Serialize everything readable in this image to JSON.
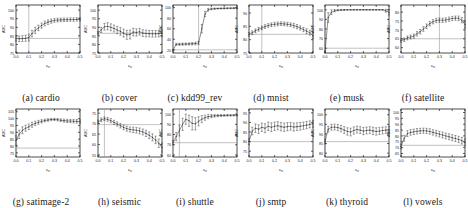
{
  "figure": {
    "xlabel": "c_p",
    "ylabel": "AUC",
    "xticks": [
      "0.0",
      "0.1",
      "0.2",
      "0.3",
      "0.4",
      "0.5"
    ],
    "xlim": [
      0.0,
      0.5
    ],
    "marker": "caret",
    "line_color": "#333333",
    "ref_line_color": "#999999",
    "vline_color": "#999999"
  },
  "chart_data": [
    {
      "type": "line",
      "panel": "a",
      "title": "(a) cardio",
      "xlabel": "c_p",
      "ylabel": "AUC",
      "xlim": [
        0.0,
        0.5
      ],
      "ylim": [
        75,
        103
      ],
      "yticks": [
        75,
        80,
        85,
        90,
        95,
        100
      ],
      "grid": false,
      "reference_line": 83.5,
      "vline": 0.1,
      "x": [
        0.0,
        0.025,
        0.05,
        0.075,
        0.1,
        0.125,
        0.15,
        0.175,
        0.2,
        0.225,
        0.25,
        0.275,
        0.3,
        0.325,
        0.35,
        0.375,
        0.4,
        0.425,
        0.45,
        0.475,
        0.5
      ],
      "values": [
        83.5,
        83.3,
        83.4,
        83.6,
        84.0,
        86.3,
        88.2,
        89.6,
        91.0,
        92.2,
        93.0,
        93.6,
        94.0,
        94.2,
        94.3,
        94.4,
        94.4,
        94.5,
        94.5,
        94.6,
        94.6
      ],
      "errors": [
        1.6,
        1.6,
        1.7,
        1.8,
        2.0,
        1.9,
        1.8,
        1.6,
        1.5,
        1.4,
        1.3,
        1.2,
        1.1,
        1.1,
        1.0,
        1.0,
        1.0,
        1.0,
        1.0,
        1.0,
        1.0
      ]
    },
    {
      "type": "line",
      "panel": "b",
      "title": "(b) cover",
      "xlabel": "c_p",
      "ylabel": "AUC",
      "xlim": [
        0.0,
        0.5
      ],
      "ylim": [
        75,
        103
      ],
      "yticks": [
        75,
        80,
        85,
        90,
        95,
        100
      ],
      "grid": false,
      "reference_line": 86.5,
      "vline": 0.0,
      "x": [
        0.0,
        0.025,
        0.05,
        0.075,
        0.1,
        0.125,
        0.15,
        0.175,
        0.2,
        0.225,
        0.25,
        0.275,
        0.3,
        0.325,
        0.35,
        0.375,
        0.4,
        0.425,
        0.45,
        0.475,
        0.5
      ],
      "values": [
        86.5,
        88.5,
        90.3,
        90.6,
        90.0,
        89.3,
        88.4,
        87.6,
        86.6,
        85.6,
        85.8,
        87.2,
        87.0,
        87.4,
        86.6,
        86.4,
        86.3,
        86.2,
        86.2,
        86.3,
        86.4
      ],
      "errors": [
        1.0,
        1.5,
        2.0,
        2.1,
        2.0,
        2.0,
        2.1,
        2.2,
        2.3,
        2.6,
        2.6,
        2.2,
        2.1,
        2.0,
        2.0,
        2.0,
        1.9,
        1.9,
        1.9,
        1.9,
        1.9
      ]
    },
    {
      "type": "line",
      "panel": "c",
      "title": "(c) kdd99_rev",
      "xlabel": "c_p",
      "ylabel": "AUC",
      "xlim": [
        0.0,
        0.5
      ],
      "ylim": [
        14,
        105
      ],
      "yticks": [
        20,
        40,
        60,
        80,
        100
      ],
      "grid": false,
      "reference_line": 20.0,
      "vline": 0.2,
      "x": [
        0.0,
        0.025,
        0.05,
        0.075,
        0.1,
        0.125,
        0.15,
        0.175,
        0.2,
        0.225,
        0.25,
        0.275,
        0.3,
        0.325,
        0.35,
        0.375,
        0.4,
        0.425,
        0.45,
        0.475,
        0.5
      ],
      "values": [
        19.5,
        30.5,
        30.5,
        30.8,
        31.0,
        31.2,
        31.5,
        32.0,
        33.0,
        60.0,
        88.0,
        96.0,
        97.5,
        98.0,
        98.3,
        98.5,
        98.6,
        98.8,
        98.9,
        99.0,
        99.0
      ],
      "errors": [
        1.0,
        2.0,
        2.0,
        2.0,
        2.0,
        2.0,
        2.2,
        2.5,
        3.0,
        8.0,
        5.0,
        2.5,
        1.5,
        1.2,
        1.0,
        1.0,
        1.0,
        0.9,
        0.9,
        0.8,
        0.8
      ]
    },
    {
      "type": "line",
      "panel": "d",
      "title": "(d) mnist",
      "xlabel": "c_p",
      "ylabel": "AUC",
      "xlim": [
        0.0,
        0.5
      ],
      "ylim": [
        75,
        93
      ],
      "yticks": [
        75,
        80,
        85,
        90
      ],
      "grid": false,
      "reference_line": 82.0,
      "vline": 0.1,
      "x": [
        0.0,
        0.025,
        0.05,
        0.075,
        0.1,
        0.125,
        0.15,
        0.175,
        0.2,
        0.225,
        0.25,
        0.275,
        0.3,
        0.325,
        0.35,
        0.375,
        0.4,
        0.425,
        0.45,
        0.475,
        0.5
      ],
      "values": [
        82.0,
        82.6,
        83.3,
        83.9,
        84.4,
        84.9,
        85.3,
        85.6,
        85.8,
        85.9,
        86.0,
        85.9,
        85.8,
        85.6,
        85.3,
        84.9,
        84.4,
        83.8,
        83.2,
        82.6,
        81.5
      ],
      "errors": [
        0.7,
        0.7,
        0.7,
        0.7,
        0.7,
        0.7,
        0.7,
        0.7,
        0.7,
        0.7,
        0.7,
        0.7,
        0.7,
        0.7,
        0.8,
        0.8,
        0.8,
        0.8,
        0.9,
        0.9,
        1.0
      ]
    },
    {
      "type": "line",
      "panel": "e",
      "title": "(e) musk",
      "xlabel": "c_p",
      "ylabel": "AUC",
      "xlim": [
        0.0,
        0.5
      ],
      "ylim": [
        55,
        105
      ],
      "yticks": [
        60,
        70,
        80,
        90,
        100
      ],
      "grid": false,
      "reference_line": 60.0,
      "vline": 0.0,
      "x": [
        0.0,
        0.025,
        0.05,
        0.075,
        0.1,
        0.125,
        0.15,
        0.175,
        0.2,
        0.225,
        0.25,
        0.275,
        0.3,
        0.325,
        0.35,
        0.375,
        0.4,
        0.425,
        0.45,
        0.475,
        0.5
      ],
      "values": [
        56.0,
        92.0,
        97.5,
        99.0,
        99.6,
        99.8,
        99.9,
        100.0,
        100.0,
        100.0,
        100.0,
        100.0,
        100.0,
        100.0,
        100.0,
        100.0,
        100.0,
        100.0,
        100.0,
        99.0,
        97.5
      ],
      "errors": [
        1.0,
        5.0,
        2.5,
        1.2,
        0.6,
        0.4,
        0.3,
        0.2,
        0.2,
        0.2,
        0.2,
        0.2,
        0.2,
        0.2,
        0.2,
        0.2,
        0.2,
        0.2,
        0.3,
        1.5,
        3.0
      ]
    },
    {
      "type": "line",
      "panel": "f",
      "title": "(f) satellite",
      "xlabel": "c_p",
      "ylabel": "AUC",
      "xlim": [
        0.0,
        0.5
      ],
      "ylim": [
        57,
        84
      ],
      "yticks": [
        60,
        65,
        70,
        75,
        80
      ],
      "grid": false,
      "reference_line": 65.0,
      "vline": 0.3,
      "x": [
        0.0,
        0.025,
        0.05,
        0.075,
        0.1,
        0.125,
        0.15,
        0.175,
        0.2,
        0.225,
        0.25,
        0.275,
        0.3,
        0.325,
        0.35,
        0.375,
        0.4,
        0.425,
        0.45,
        0.475,
        0.5
      ],
      "values": [
        64.0,
        64.5,
        65.5,
        66.0,
        66.5,
        67.8,
        69.0,
        70.5,
        72.0,
        73.5,
        74.6,
        75.3,
        75.5,
        75.4,
        75.6,
        76.0,
        76.4,
        76.6,
        76.5,
        75.5,
        73.0
      ],
      "errors": [
        1.0,
        1.0,
        1.1,
        1.1,
        1.2,
        1.2,
        1.3,
        1.3,
        1.3,
        1.3,
        1.2,
        1.2,
        1.2,
        1.2,
        1.2,
        1.2,
        1.2,
        1.2,
        1.3,
        1.5,
        2.0
      ]
    },
    {
      "type": "line",
      "panel": "g",
      "title": "(g) satimage-2",
      "xlabel": "c_p",
      "ylabel": "AUC",
      "xlim": [
        0.0,
        0.5
      ],
      "ylim": [
        72,
        107
      ],
      "yticks": [
        75,
        80,
        85,
        90,
        95,
        100,
        105
      ],
      "grid": false,
      "reference_line": 78.5,
      "vline": 0.0,
      "x": [
        0.0,
        0.025,
        0.05,
        0.075,
        0.1,
        0.125,
        0.15,
        0.175,
        0.2,
        0.225,
        0.25,
        0.275,
        0.3,
        0.325,
        0.35,
        0.375,
        0.4,
        0.425,
        0.45,
        0.475,
        0.5
      ],
      "values": [
        84.0,
        88.5,
        91.5,
        93.0,
        94.0,
        95.5,
        96.5,
        97.3,
        98.0,
        98.6,
        99.0,
        99.3,
        99.4,
        99.2,
        98.8,
        98.5,
        98.3,
        98.2,
        98.1,
        98.0,
        97.8
      ],
      "errors": [
        3.5,
        3.0,
        2.5,
        2.2,
        2.0,
        1.8,
        1.6,
        1.4,
        1.2,
        1.0,
        0.9,
        0.8,
        0.8,
        0.9,
        1.0,
        1.1,
        1.2,
        1.2,
        1.2,
        1.3,
        1.3
      ]
    },
    {
      "type": "line",
      "panel": "h",
      "title": "(h) seismic",
      "xlabel": "c_p",
      "ylabel": "AUC",
      "xlim": [
        0.0,
        0.5
      ],
      "ylim": [
        54,
        77
      ],
      "yticks": [
        55,
        60,
        65,
        70,
        75
      ],
      "grid": false,
      "reference_line": 69.5,
      "vline": 0.05,
      "x": [
        0.0,
        0.025,
        0.05,
        0.075,
        0.1,
        0.125,
        0.15,
        0.175,
        0.2,
        0.225,
        0.25,
        0.275,
        0.3,
        0.325,
        0.35,
        0.375,
        0.4,
        0.425,
        0.45,
        0.475,
        0.5
      ],
      "values": [
        70.8,
        71.8,
        72.3,
        72.0,
        71.4,
        70.6,
        69.8,
        69.0,
        68.2,
        67.6,
        67.2,
        67.0,
        66.8,
        66.5,
        66.0,
        65.3,
        64.4,
        63.4,
        62.2,
        60.6,
        58.5
      ],
      "errors": [
        0.9,
        0.9,
        0.9,
        0.9,
        1.0,
        1.0,
        1.0,
        1.1,
        1.1,
        1.2,
        1.2,
        1.3,
        1.3,
        1.4,
        1.4,
        1.5,
        1.6,
        1.7,
        1.8,
        2.0,
        2.2
      ]
    },
    {
      "type": "line",
      "panel": "i",
      "title": "(i) shuttle",
      "xlabel": "c_p",
      "ylabel": "AUC",
      "xlim": [
        0.0,
        0.5
      ],
      "ylim": [
        58,
        105
      ],
      "yticks": [
        60,
        70,
        80,
        90,
        100
      ],
      "grid": false,
      "reference_line": 72.0,
      "vline": 0.05,
      "x": [
        0.0,
        0.025,
        0.05,
        0.075,
        0.1,
        0.125,
        0.15,
        0.175,
        0.2,
        0.225,
        0.25,
        0.275,
        0.3,
        0.325,
        0.35,
        0.375,
        0.4,
        0.425,
        0.45,
        0.475,
        0.5
      ],
      "values": [
        72.0,
        78.0,
        84.0,
        90.0,
        95.0,
        93.5,
        91.0,
        90.5,
        93.0,
        95.0,
        96.5,
        97.5,
        98.0,
        98.3,
        98.5,
        98.6,
        98.7,
        98.8,
        98.8,
        98.9,
        98.9
      ],
      "errors": [
        2.0,
        4.0,
        5.5,
        6.0,
        5.0,
        5.5,
        6.5,
        6.0,
        4.5,
        3.5,
        2.5,
        2.0,
        1.5,
        1.2,
        1.0,
        0.9,
        0.8,
        0.8,
        0.7,
        0.7,
        0.7
      ]
    },
    {
      "type": "line",
      "panel": "j",
      "title": "(j) smtp",
      "xlabel": "c_p",
      "ylabel": "AUC",
      "xlim": [
        0.0,
        0.5
      ],
      "ylim": [
        72,
        97
      ],
      "yticks": [
        75,
        80,
        85,
        90,
        95
      ],
      "grid": false,
      "reference_line": 80.0,
      "vline": 0.0,
      "x": [
        0.0,
        0.025,
        0.05,
        0.075,
        0.1,
        0.125,
        0.15,
        0.175,
        0.2,
        0.225,
        0.25,
        0.275,
        0.3,
        0.325,
        0.35,
        0.375,
        0.4,
        0.425,
        0.45,
        0.475,
        0.5
      ],
      "values": [
        80.0,
        85.5,
        87.0,
        86.5,
        87.5,
        87.0,
        88.0,
        87.5,
        88.0,
        88.3,
        87.8,
        87.5,
        87.8,
        88.0,
        87.6,
        87.8,
        88.0,
        88.3,
        88.6,
        89.0,
        89.3
      ],
      "errors": [
        1.5,
        2.0,
        2.2,
        2.3,
        2.2,
        2.3,
        2.2,
        2.3,
        2.2,
        2.1,
        2.2,
        2.2,
        2.1,
        2.0,
        2.1,
        2.0,
        2.0,
        1.9,
        1.9,
        1.8,
        1.8
      ]
    },
    {
      "type": "line",
      "panel": "k",
      "title": "(k) thyroid",
      "xlabel": "c_p",
      "ylabel": "AUC",
      "xlim": [
        0.0,
        0.5
      ],
      "ylim": [
        78,
        103
      ],
      "yticks": [
        80,
        85,
        90,
        95,
        100
      ],
      "grid": false,
      "reference_line": 86.0,
      "vline": 0.0,
      "x": [
        0.0,
        0.025,
        0.05,
        0.075,
        0.1,
        0.125,
        0.15,
        0.175,
        0.2,
        0.225,
        0.25,
        0.275,
        0.3,
        0.325,
        0.35,
        0.375,
        0.4,
        0.425,
        0.45,
        0.475,
        0.5
      ],
      "values": [
        86.0,
        92.5,
        93.5,
        93.6,
        93.3,
        92.8,
        92.0,
        91.3,
        91.0,
        91.8,
        92.3,
        92.0,
        91.5,
        91.8,
        92.0,
        91.6,
        91.3,
        91.5,
        91.8,
        92.0,
        92.2
      ],
      "errors": [
        1.2,
        1.5,
        1.5,
        1.5,
        1.6,
        1.7,
        1.8,
        1.9,
        2.0,
        1.9,
        1.8,
        1.8,
        1.9,
        1.8,
        1.8,
        1.9,
        1.9,
        1.8,
        1.8,
        1.7,
        1.7
      ]
    },
    {
      "type": "line",
      "panel": "l",
      "title": "(l) vowels",
      "xlabel": "c_p",
      "ylabel": "AUC",
      "xlim": [
        0.0,
        0.5
      ],
      "ylim": [
        62,
        103
      ],
      "yticks": [
        65,
        70,
        75,
        80,
        85,
        90,
        95,
        100
      ],
      "grid": false,
      "reference_line": 72.0,
      "vline": 0.0,
      "x": [
        0.0,
        0.025,
        0.05,
        0.075,
        0.1,
        0.125,
        0.15,
        0.175,
        0.2,
        0.225,
        0.25,
        0.275,
        0.3,
        0.325,
        0.35,
        0.375,
        0.4,
        0.425,
        0.45,
        0.475,
        0.5
      ],
      "values": [
        71.0,
        78.0,
        82.0,
        83.0,
        83.5,
        84.0,
        84.3,
        84.5,
        84.3,
        83.8,
        83.0,
        82.3,
        81.5,
        80.8,
        80.0,
        79.3,
        78.5,
        77.8,
        77.0,
        76.0,
        74.5
      ],
      "errors": [
        2.0,
        2.5,
        2.5,
        2.4,
        2.3,
        2.3,
        2.2,
        2.2,
        2.2,
        2.3,
        2.3,
        2.4,
        2.4,
        2.5,
        2.5,
        2.5,
        2.6,
        2.6,
        2.7,
        2.8,
        3.0
      ]
    }
  ]
}
